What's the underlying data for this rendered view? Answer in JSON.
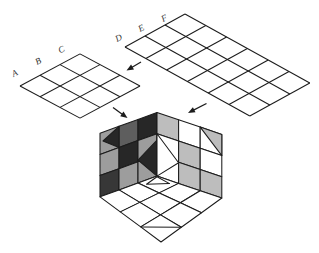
{
  "figure": {
    "background": "#ffffff",
    "stroke": "#1c1c1c",
    "palette": {
      "white": "#ffffff",
      "light": "#bdbdbd",
      "mid": "#9d9d9d",
      "dark": "#5e5e5e",
      "dark2": "#373737",
      "darkest": "#272727"
    },
    "left_grid": {
      "labels": [
        "A",
        "B",
        "C"
      ],
      "rows": 3,
      "cols": 3,
      "fill": "white"
    },
    "right_grid": {
      "labels": [
        "D",
        "E",
        "F"
      ],
      "rows": 3,
      "cols": 6,
      "fill": "white"
    },
    "arrows": [
      {
        "name": "arrow-between-grids",
        "from": [
          141,
          62
        ],
        "to": [
          126.5,
          70.5
        ]
      },
      {
        "name": "arrow-left-grid-to-cube",
        "from": [
          113,
          107.5
        ],
        "to": [
          127.5,
          118
        ]
      },
      {
        "name": "arrow-right-grid-to-cube",
        "from": [
          206.5,
          103.5
        ],
        "to": [
          188,
          113
        ]
      }
    ],
    "cube": {
      "left_face_shades": [
        [
          "mid",
          "dark",
          "darkest"
        ],
        [
          "mid",
          "darkest",
          "mid"
        ],
        [
          "dark2",
          "mid",
          "mid"
        ]
      ],
      "right_face_shades": [
        [
          "light",
          "white",
          "white"
        ],
        [
          "white",
          "light",
          "white"
        ],
        [
          "white",
          "light",
          "light"
        ]
      ],
      "bottom_face_shades": [
        [
          "white",
          "white",
          "white"
        ],
        [
          "white",
          "white",
          "white"
        ],
        [
          "white",
          "white",
          "white"
        ]
      ],
      "overlays": [
        {
          "name": "left-face-r1c1-triangle",
          "fill": "darkest"
        },
        {
          "name": "left-face-center-wedge",
          "fill": "darkest"
        },
        {
          "name": "right-face-center-wedge",
          "fill": "white"
        },
        {
          "name": "right-face-r1c3-half",
          "fill": "light"
        },
        {
          "name": "bottom-face-top-triangle",
          "fill": "white"
        },
        {
          "name": "bottom-face-bottom-line",
          "fill": "none"
        }
      ]
    }
  }
}
